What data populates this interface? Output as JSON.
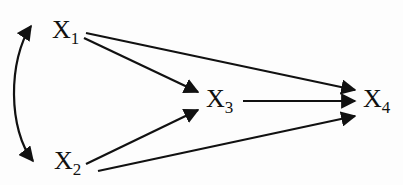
{
  "diagram": {
    "type": "path diagram",
    "nodes": [
      {
        "id": "X1",
        "label": "X",
        "sub": "1",
        "x": 52,
        "y": 20
      },
      {
        "id": "X2",
        "label": "X",
        "sub": "2",
        "x": 52,
        "y": 152
      },
      {
        "id": "X3",
        "label": "X",
        "sub": "3",
        "x": 205,
        "y": 85
      },
      {
        "id": "X4",
        "label": "X",
        "sub": "4",
        "x": 362,
        "y": 85
      }
    ],
    "edges": [
      {
        "from": "X1",
        "to": "X2",
        "style": "curved double-headed"
      },
      {
        "from": "X1",
        "to": "X3",
        "style": "directed"
      },
      {
        "from": "X1",
        "to": "X4",
        "style": "directed"
      },
      {
        "from": "X2",
        "to": "X3",
        "style": "directed"
      },
      {
        "from": "X2",
        "to": "X4",
        "style": "directed"
      },
      {
        "from": "X3",
        "to": "X4",
        "style": "directed"
      }
    ],
    "colors": {
      "line": "#111111",
      "background": "#fdfdfd"
    }
  }
}
